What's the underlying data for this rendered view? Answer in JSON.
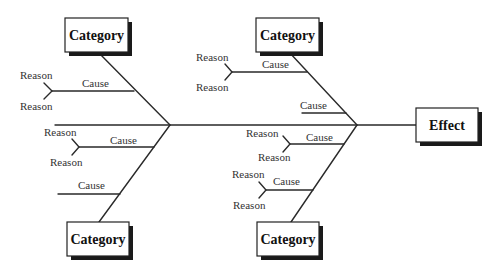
{
  "diagram": {
    "type": "fishbone",
    "effect": {
      "label": "Effect"
    },
    "categories": [
      {
        "position": "top-left",
        "label": "Category",
        "causes": [
          {
            "label": "Cause",
            "reasons": [
              "Reason",
              "Reason"
            ]
          }
        ]
      },
      {
        "position": "bottom-left",
        "label": "Category",
        "causes": [
          {
            "label": "Cause",
            "reasons": [
              "Reason",
              "Reason"
            ]
          },
          {
            "label": "Cause",
            "reasons": []
          }
        ]
      },
      {
        "position": "top-right",
        "label": "Category",
        "causes": [
          {
            "label": "Cause",
            "reasons": [
              "Reason",
              "Reason"
            ]
          },
          {
            "label": "Cause",
            "reasons": []
          }
        ]
      },
      {
        "position": "bottom-right",
        "label": "Category",
        "causes": [
          {
            "label": "Cause",
            "reasons": [
              "Reason",
              "Reason"
            ]
          },
          {
            "label": "Cause",
            "reasons": [
              "Reason",
              "Reason"
            ]
          }
        ]
      }
    ]
  },
  "colors": {
    "line": "#2a2a2a",
    "shadow": "#1a1a1a",
    "background": "#ffffff"
  }
}
